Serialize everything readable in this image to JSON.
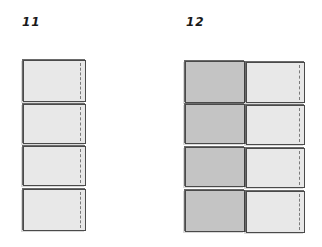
{
  "diagrams": [
    {
      "label": "11",
      "columns": [
        {
          "shade": "light",
          "tiles": 4,
          "seam": true
        }
      ]
    },
    {
      "label": "12",
      "columns": [
        {
          "shade": "dark",
          "tiles": 4,
          "seam": false
        },
        {
          "shade": "light",
          "tiles": 4,
          "seam": true
        }
      ]
    }
  ],
  "colors": {
    "light_fill": "#e8e8e8",
    "dark_fill": "#c4c4c4",
    "outline": "#4a4a4a"
  }
}
